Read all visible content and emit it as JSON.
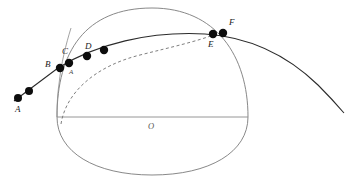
{
  "figure": {
    "background_color": "#ffffff",
    "width": 363,
    "height": 192
  },
  "colors": {
    "oval_stroke": "#7a7a7a",
    "chord_stroke": "#8a8a8a",
    "trajectory_stroke": "#2b2b2b",
    "dashed_stroke": "#6f6f6f",
    "dot_fill": "#0d0d0d",
    "label_fill": "#1a1a1a",
    "label_muted_fill": "#555555"
  },
  "shapes": {
    "oval": {
      "name": "outer-oval",
      "style": "solid",
      "left_x": 57,
      "right_x": 248,
      "top_y": 8,
      "bottom_y": 175,
      "path": "M 57,117 C 57,52 85,8 152,8 C 216,8 248,56 248,117 C 248,152 210,175 152,175 C 95,175 57,152 57,117 Z"
    },
    "chord": {
      "name": "horizontal-chord",
      "style": "solid",
      "x1": 57,
      "y1": 117,
      "x2": 248,
      "y2": 117
    },
    "trajectory": {
      "name": "trajectory-curve",
      "style": "solid",
      "path": "M 14,101 L 58,68 C 96,44 150,31 205,34 C 250,37 288,56 318,85 C 330,97 338,106 344,113"
    },
    "dashed_arc": {
      "name": "dashed-arc",
      "style": "dashed",
      "dash_pattern": "3,2.5",
      "path": "M 61,124 C 66,92 96,66 140,55 C 172,47 198,41 213,35"
    },
    "oval_left_tangent_line": {
      "name": "oval-left-edge-line",
      "style": "solid",
      "path": "M 71,28 C 66,44 61,64 59,84 C 57,98 57,110 57,117"
    }
  },
  "points": [
    {
      "id": "A",
      "name": "point-a",
      "cx": 18,
      "cy": 98,
      "r": 4.0,
      "label": "A",
      "label_x": 15,
      "label_y": 112,
      "labeled": true
    },
    {
      "id": "A2",
      "name": "point-a2",
      "cx": 29,
      "cy": 91,
      "r": 4.0,
      "label": "",
      "label_x": 0,
      "label_y": 0,
      "labeled": false
    },
    {
      "id": "B",
      "name": "point-b",
      "cx": 60,
      "cy": 68,
      "r": 4.2,
      "label": "B",
      "label_x": 45,
      "label_y": 67,
      "labeled": true
    },
    {
      "id": "C",
      "name": "point-c",
      "cx": 69,
      "cy": 63,
      "r": 4.2,
      "label": "C",
      "label_x": 62,
      "label_y": 54,
      "labeled": true
    },
    {
      "id": "D",
      "name": "point-d",
      "cx": 87,
      "cy": 56,
      "r": 4.2,
      "label": "D",
      "label_x": 85,
      "label_y": 49,
      "labeled": true
    },
    {
      "id": "D2",
      "name": "point-d2",
      "cx": 104,
      "cy": 50,
      "r": 4.2,
      "label": "",
      "label_x": 0,
      "label_y": 0,
      "labeled": false
    },
    {
      "id": "E",
      "name": "point-e",
      "cx": 213,
      "cy": 34,
      "r": 4.2,
      "label": "E",
      "label_x": 208,
      "label_y": 47,
      "labeled": true
    },
    {
      "id": "F",
      "name": "point-f",
      "cx": 223,
      "cy": 33,
      "r": 4.2,
      "label": "F",
      "label_x": 229,
      "label_y": 25,
      "labeled": true
    }
  ],
  "annotations": {
    "intersection_small_label": {
      "name": "intersection-label-a",
      "text": "A",
      "x": 69,
      "y": 74
    },
    "center_label": {
      "name": "oval-center-label",
      "text": "O",
      "x": 148,
      "y": 129
    }
  }
}
